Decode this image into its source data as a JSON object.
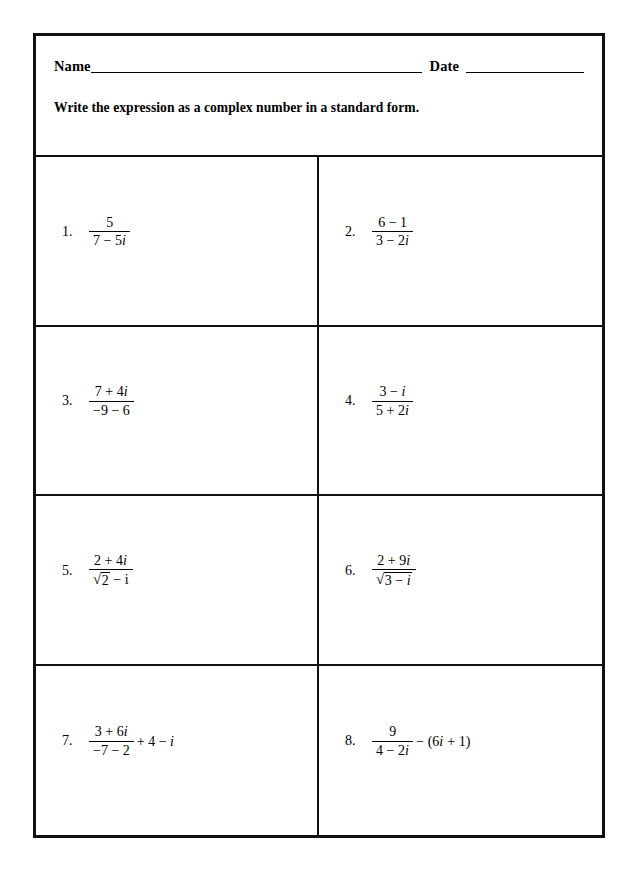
{
  "header": {
    "name_label": "Name",
    "date_label": "Date",
    "instruction": "Write the expression as a complex number in a standard form."
  },
  "problems": [
    {
      "number": "1.",
      "numerator": "5",
      "denominator": "7 − 5i",
      "tail": ""
    },
    {
      "number": "2.",
      "numerator": "6 − 1",
      "denominator": "3 − 2i",
      "tail": ""
    },
    {
      "number": "3.",
      "numerator": "7 + 4i",
      "denominator": "−9 − 6",
      "tail": ""
    },
    {
      "number": "4.",
      "numerator": "3 − i",
      "denominator": "5 + 2i",
      "tail": ""
    },
    {
      "number": "5.",
      "numerator": "2 + 4i",
      "denominator": "√2 − i",
      "den_radicand": "2",
      "den_after_radical": " − i",
      "tail": ""
    },
    {
      "number": "6.",
      "numerator": "2 + 9i",
      "denominator": "√(3 − i)",
      "den_radicand": "3 − i",
      "den_after_radical": "",
      "tail": ""
    },
    {
      "number": "7.",
      "numerator": "3 + 6i",
      "denominator": "−7 − 2",
      "tail": "+ 4 − i"
    },
    {
      "number": "8.",
      "numerator": "9",
      "denominator": "4 − 2i",
      "tail": "− (6i + 1)"
    }
  ],
  "icons": {
    "radical": "√"
  },
  "colors": {
    "border": "#111111",
    "text": "#000000",
    "page": "#ffffff"
  }
}
